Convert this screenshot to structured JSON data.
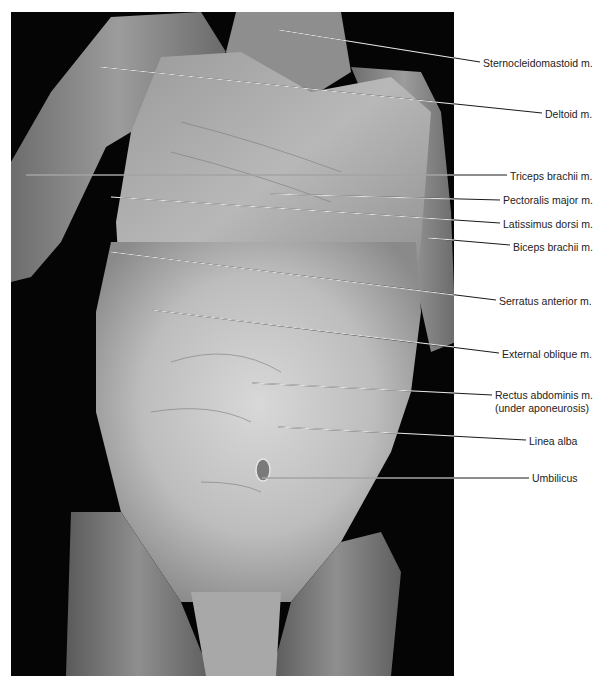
{
  "figure": {
    "photo": {
      "x": 11,
      "y": 12,
      "width": 443,
      "height": 664,
      "background_color": "#050505",
      "tissue_color": "#c8c8c8"
    },
    "line_color": "#1a1a1a",
    "labels": [
      {
        "id": "sternocleidomastoid",
        "text": "Sternocleidomastoid m.",
        "text_x": 483,
        "text_y": 57,
        "line": [
          [
            279,
            30
          ],
          [
            480,
            62
          ]
        ]
      },
      {
        "id": "deltoid",
        "text": "Deltoid m.",
        "text_x": 545,
        "text_y": 108,
        "line": [
          [
            100,
            67
          ],
          [
            542,
            113
          ]
        ]
      },
      {
        "id": "triceps-brachii",
        "text": "Triceps brachii m.",
        "text_x": 510,
        "text_y": 170,
        "line": [
          [
            26,
            175
          ],
          [
            507,
            175
          ]
        ]
      },
      {
        "id": "pectoralis-major",
        "text": "Pectoralis major m.",
        "text_x": 503,
        "text_y": 194,
        "line": [
          [
            270,
            194
          ],
          [
            500,
            200
          ]
        ]
      },
      {
        "id": "latissimus-dorsi",
        "text": "Latissimus dorsi m.",
        "text_x": 503,
        "text_y": 218,
        "line": [
          [
            111,
            197
          ],
          [
            500,
            223
          ]
        ]
      },
      {
        "id": "biceps-brachii",
        "text": "Biceps brachii m.",
        "text_x": 513,
        "text_y": 241,
        "line": [
          [
            428,
            238
          ],
          [
            510,
            245
          ]
        ]
      },
      {
        "id": "serratus-anterior",
        "text": "Serratus anterior m.",
        "text_x": 499,
        "text_y": 295,
        "line": [
          [
            111,
            252
          ],
          [
            496,
            300
          ]
        ]
      },
      {
        "id": "external-oblique",
        "text": "External oblique m.",
        "text_x": 502,
        "text_y": 348,
        "line": [
          [
            152,
            310
          ],
          [
            499,
            353
          ]
        ]
      },
      {
        "id": "rectus-abdominis",
        "text": "Rectus abdominis  m.",
        "text2": "(under aponeurosis)",
        "text_x": 495,
        "text_y": 391,
        "line": [
          [
            252,
            383
          ],
          [
            492,
            395
          ]
        ]
      },
      {
        "id": "linea-alba",
        "text": "Linea alba",
        "text_x": 529,
        "text_y": 437,
        "line": [
          [
            278,
            427
          ],
          [
            526,
            440
          ]
        ]
      },
      {
        "id": "umbilicus",
        "text": "Umbilicus",
        "text_x": 532,
        "text_y": 473,
        "line": [
          [
            262,
            478
          ],
          [
            529,
            478
          ]
        ]
      }
    ]
  }
}
